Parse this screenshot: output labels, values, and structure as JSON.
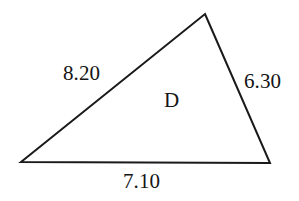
{
  "figure": {
    "type": "triangle-diagram",
    "background_color": "#ffffff",
    "stroke_color": "#1a1a1a",
    "text_color": "#141414"
  },
  "shape": {
    "name": "triangle",
    "vertices": {
      "apex": {
        "x": 205,
        "y": 14
      },
      "bottom_left": {
        "x": 21,
        "y": 162
      },
      "bottom_right": {
        "x": 270,
        "y": 163
      }
    },
    "interior_label": "D"
  },
  "labels": {
    "left_side": "8.20",
    "right_side": "6.30",
    "base_side": "7.10",
    "interior": "D"
  },
  "chart_data": {
    "type": "diagram",
    "shape": "triangle",
    "side_lengths": [
      {
        "side": "left",
        "label": "8.20",
        "value": 8.2
      },
      {
        "side": "right",
        "label": "6.30",
        "value": 6.3
      },
      {
        "side": "base",
        "label": "7.10",
        "value": 7.1
      }
    ],
    "region_label": "D"
  }
}
